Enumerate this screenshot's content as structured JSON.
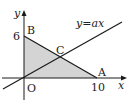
{
  "diagram": {
    "axes": {
      "x_label": "x",
      "y_label": "y",
      "origin_label": "O"
    },
    "points": {
      "A": {
        "label": "A",
        "x": 10,
        "y": 0
      },
      "B": {
        "label": "B",
        "x": 0,
        "y": 6
      },
      "C": {
        "label": "C"
      },
      "O": {
        "label": "O",
        "x": 0,
        "y": 0
      }
    },
    "ticks": {
      "x_tick": "10",
      "y_tick": "6"
    },
    "line_label": "y=ax",
    "colors": {
      "shade": "#d4d4d4",
      "line": "#1a1a1a"
    }
  }
}
